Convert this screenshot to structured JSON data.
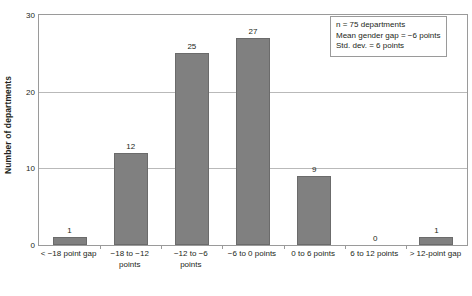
{
  "chart_data": {
    "type": "bar",
    "title": "",
    "xlabel": "",
    "ylabel": "Number of departments",
    "categories": [
      "< −18 point gap",
      "−18 to −12 points",
      "−12 to −6 points",
      "−6 to 0 points",
      "0 to 6 points",
      "6 to 12 points",
      "> 12-point gap"
    ],
    "category_lines": [
      [
        "< −18 point gap"
      ],
      [
        "−18 to −12",
        "points"
      ],
      [
        "−12 to −6",
        "points"
      ],
      [
        "−6 to 0 points"
      ],
      [
        "0 to 6 points"
      ],
      [
        "6 to 12 points"
      ],
      [
        "> 12-point gap"
      ]
    ],
    "values": [
      1,
      12,
      25,
      27,
      9,
      0,
      1
    ],
    "value_labels": [
      "1",
      "12",
      "25",
      "27",
      "9",
      "0",
      "1"
    ],
    "ylim": [
      0,
      30
    ],
    "yticks": [
      0,
      10,
      20,
      30
    ],
    "ytick_labels": [
      "0",
      "10",
      "20",
      "30"
    ],
    "grid": true,
    "legend": "none",
    "bar_color": "#808080",
    "bar_border_color": "#6b6b6b",
    "grid_color": "#b9b9b9",
    "axis_color": "#9a9a9a"
  },
  "annotation": {
    "line1": "n = 75 departments",
    "line2": "Mean gender gap = −6 points",
    "line3": "Std. dev. = 6 points"
  }
}
